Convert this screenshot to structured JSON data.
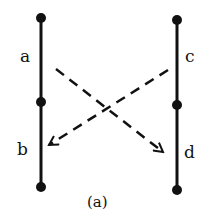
{
  "diagram": {
    "caption": "(a)",
    "left_line": {
      "labels": {
        "upper": "a",
        "lower": "b"
      },
      "x": 41,
      "nodes_y": [
        18,
        102,
        187
      ]
    },
    "right_line": {
      "labels": {
        "upper": "c",
        "lower": "d"
      },
      "x": 177,
      "nodes_y": [
        20,
        105,
        190
      ]
    },
    "arrows": [
      {
        "from": "a",
        "to": "d",
        "style": "dashed"
      },
      {
        "from": "c",
        "to": "b",
        "style": "dashed"
      }
    ],
    "colors": {
      "ink": "#111111",
      "background": "#ffffff"
    }
  }
}
